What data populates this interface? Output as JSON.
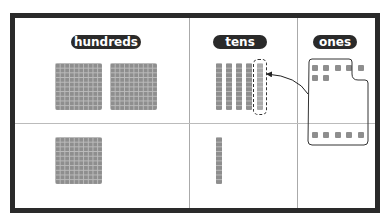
{
  "columns": [
    {
      "label": "hundreds"
    },
    {
      "label": "tens"
    },
    {
      "label": "ones"
    }
  ],
  "top_row": {
    "hundreds": 2,
    "tens": 5,
    "ones": 7
  },
  "bottom_row": {
    "hundreds": 1,
    "tens": 1,
    "ones": 5
  },
  "colors": {
    "frame": "#2a2a2a",
    "block": "#8e8e8e",
    "label_bg": "#2a2a2a",
    "label_text": "#ffffff"
  },
  "annotation": "ten ones regrouped into one ten"
}
